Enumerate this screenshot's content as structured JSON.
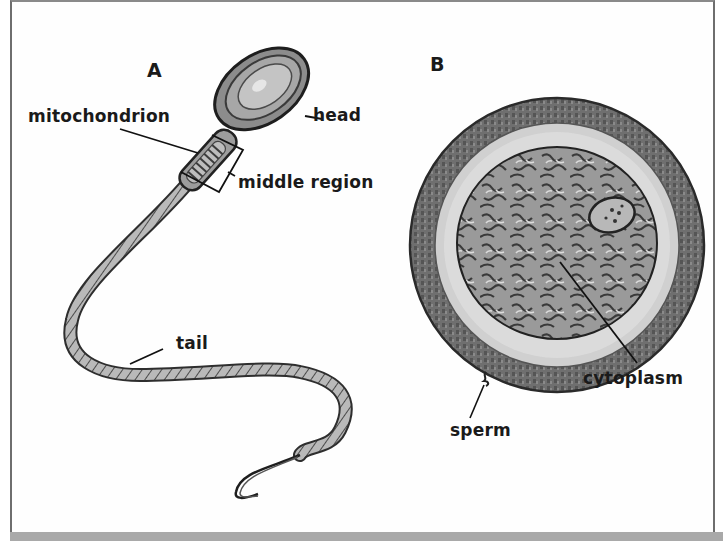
{
  "diagram": {
    "panels": [
      {
        "id": "A",
        "label": "A",
        "subject": "sperm cell"
      },
      {
        "id": "B",
        "label": "B",
        "subject": "egg cell"
      }
    ],
    "labels_a": {
      "head": "head",
      "mitochondrion": "mitochondrion",
      "middle_region": "middle region",
      "tail": "tail"
    },
    "labels_b": {
      "cytoplasm": "cytoplasm",
      "sperm": "sperm"
    },
    "colors": {
      "frame": "#6e6e6e",
      "bottom_bar": "#a9a9a9",
      "outer_layer": "#6b6b6b",
      "jelly_layer": "#d4d4d4",
      "cytoplasm": "#8a8a8a",
      "ink": "#1a1a1a"
    }
  }
}
